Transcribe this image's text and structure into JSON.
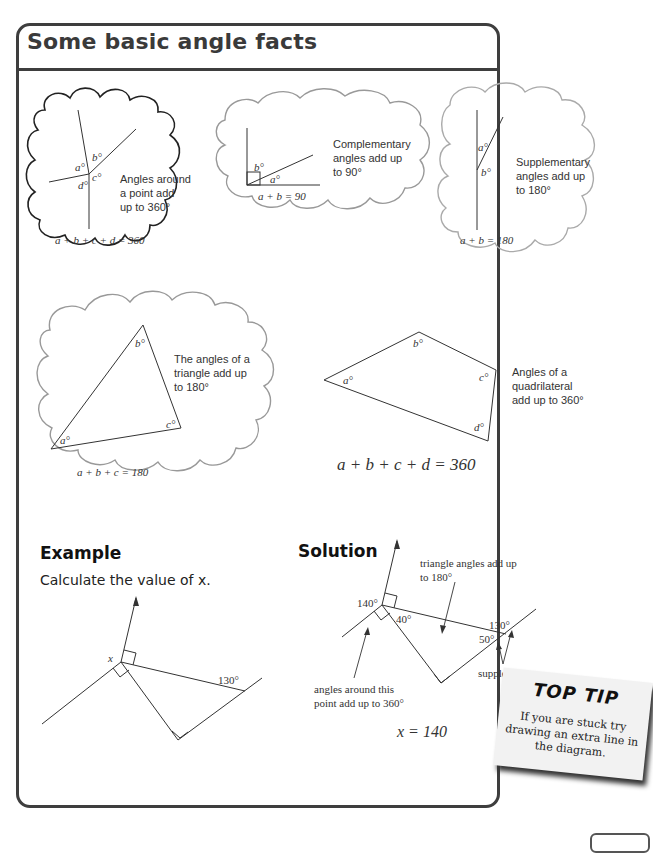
{
  "title": "Some basic angle facts",
  "facts": {
    "around_point": {
      "labels": [
        "a°",
        "b°",
        "c°",
        "d°"
      ],
      "text": [
        "Angles around",
        "a point add",
        "up to 360°"
      ],
      "equation": "a + b + c + d = 360"
    },
    "complementary": {
      "labels": [
        "b°",
        "a°"
      ],
      "text": [
        "Complementary",
        "angles add up",
        "to 90°"
      ],
      "equation": "a + b = 90"
    },
    "supplementary": {
      "labels": [
        "a°",
        "b°"
      ],
      "text": [
        "Supplementary",
        "angles add up",
        "to 180°"
      ],
      "equation": "a + b = 180"
    },
    "triangle": {
      "labels": [
        "a°",
        "b°",
        "c°"
      ],
      "text": [
        "The angles of a",
        "triangle add up",
        "to 180°"
      ],
      "equation": "a + b + c = 180"
    },
    "quadrilateral": {
      "labels": [
        "a°",
        "b°",
        "c°",
        "d°"
      ],
      "text": [
        "Angles of a",
        "quadrilateral",
        "add up to 360°"
      ],
      "equation": "a + b + c + d = 360"
    }
  },
  "example": {
    "heading": "Example",
    "question": "Calculate the value of x.",
    "labels": {
      "x": "x",
      "angle": "130°"
    }
  },
  "solution": {
    "heading": "Solution",
    "labels": {
      "a140": "140°",
      "a40": "40°",
      "a130": "130°",
      "a50": "50°"
    },
    "notes": {
      "triangle": [
        "triangle angles add up",
        "to 180°"
      ],
      "point": [
        "angles around this",
        "point add up to 360°"
      ],
      "supplementary": "supplementary"
    },
    "answer": "x = 140"
  },
  "top_tip": {
    "title": "TOP TIP",
    "lines": [
      "If you are stuck try",
      "drawing an extra line in",
      "the diagram."
    ]
  }
}
